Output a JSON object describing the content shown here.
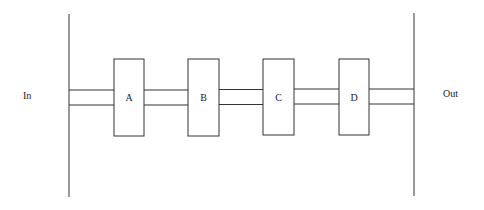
{
  "diagram": {
    "type": "pipeline",
    "input_label": "In",
    "output_label": "Out",
    "stages": [
      {
        "id": "A",
        "label": "A",
        "x": 114,
        "width": 30
      },
      {
        "id": "B",
        "label": "B",
        "x": 188,
        "width": 31
      },
      {
        "id": "C",
        "label": "C",
        "x": 263,
        "width": 31
      },
      {
        "id": "D",
        "label": "D",
        "x": 339,
        "width": 30
      }
    ],
    "connections": [
      {
        "from": "In",
        "to": "A"
      },
      {
        "from": "A",
        "to": "B"
      },
      {
        "from": "B",
        "to": "C"
      },
      {
        "from": "C",
        "to": "D"
      },
      {
        "from": "D",
        "to": "Out"
      }
    ],
    "colors": {
      "stroke": "#333333",
      "background": "#ffffff",
      "box_fill": "#ffffff"
    }
  }
}
